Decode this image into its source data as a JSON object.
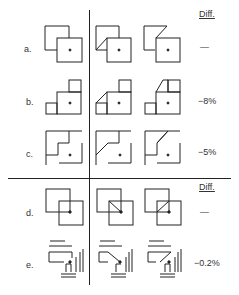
{
  "headers": {
    "top": "Diff.",
    "bottom": "Diff."
  },
  "rows": [
    {
      "label": "a.",
      "diff": "—"
    },
    {
      "label": "b.",
      "diff": "−8%"
    },
    {
      "label": "c.",
      "diff": "−5%"
    },
    {
      "label": "d.",
      "diff": "—"
    },
    {
      "label": "e.",
      "diff": "−0.2%"
    }
  ],
  "colors": {
    "ink": "#222222",
    "background": "#ffffff"
  }
}
